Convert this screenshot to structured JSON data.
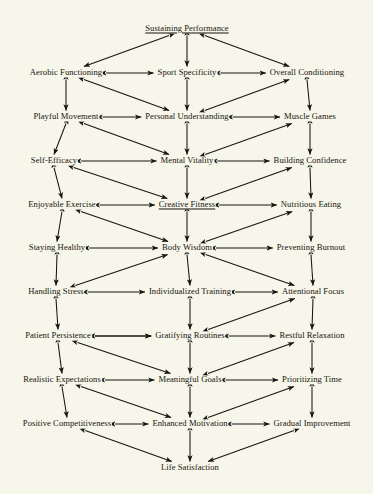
{
  "diagram": {
    "type": "concept-map",
    "background_color": "#f7f6ea",
    "text_color": "#17150f",
    "edge_color": "#17150f",
    "rows": [
      {
        "row": 1,
        "y": 29,
        "nodes": [
          {
            "id": "sustaining-performance",
            "label": "Sustaining Performance",
            "x": 187,
            "column": "center",
            "highlight": true
          }
        ]
      },
      {
        "row": 2,
        "y": 73,
        "nodes": [
          {
            "id": "aerobic-functioning",
            "label": "Aerobic Functioning",
            "x": 66,
            "column": "left",
            "highlight": false
          },
          {
            "id": "sport-specificity",
            "label": "Sport Specificity",
            "x": 187,
            "column": "center",
            "highlight": false
          },
          {
            "id": "overall-conditioning",
            "label": "Overall Conditioning",
            "x": 307,
            "column": "right",
            "highlight": false
          }
        ]
      },
      {
        "row": 3,
        "y": 117,
        "nodes": [
          {
            "id": "playful-movement",
            "label": "Playful Movement",
            "x": 66,
            "column": "left",
            "highlight": false
          },
          {
            "id": "personal-understanding",
            "label": "Personal Understanding",
            "x": 187,
            "column": "center",
            "highlight": false
          },
          {
            "id": "muscle-games",
            "label": "Muscle Games",
            "x": 310,
            "column": "right",
            "highlight": false
          }
        ]
      },
      {
        "row": 4,
        "y": 161,
        "nodes": [
          {
            "id": "self-efficacy",
            "label": "Self-Efficacy",
            "x": 54,
            "column": "left",
            "highlight": false
          },
          {
            "id": "mental-vitality",
            "label": "Mental Vitality",
            "x": 187,
            "column": "center",
            "highlight": false
          },
          {
            "id": "building-confidence",
            "label": "Building Confidence",
            "x": 310,
            "column": "right",
            "highlight": false
          }
        ]
      },
      {
        "row": 5,
        "y": 205,
        "nodes": [
          {
            "id": "enjoyable-exercise",
            "label": "Enjoyable Exercise",
            "x": 62,
            "column": "left",
            "highlight": false
          },
          {
            "id": "creative-fitness",
            "label": "Creative Fitness",
            "x": 187,
            "column": "center",
            "highlight": true
          },
          {
            "id": "nutritious-eating",
            "label": "Nutritious Eating",
            "x": 311,
            "column": "right",
            "highlight": false
          }
        ]
      },
      {
        "row": 6,
        "y": 248,
        "nodes": [
          {
            "id": "staying-healthy",
            "label": "Staying Healthy",
            "x": 57,
            "column": "left",
            "highlight": false
          },
          {
            "id": "body-wisdom",
            "label": "Body Wisdom",
            "x": 187,
            "column": "center",
            "highlight": false
          },
          {
            "id": "preventing-burnout",
            "label": "Preventing Burnout",
            "x": 311,
            "column": "right",
            "highlight": false
          }
        ]
      },
      {
        "row": 7,
        "y": 292,
        "nodes": [
          {
            "id": "handling-stress",
            "label": "Handling Stress",
            "x": 56,
            "column": "left",
            "highlight": false
          },
          {
            "id": "individualized-training",
            "label": "Individualized Training",
            "x": 190,
            "column": "center",
            "highlight": false
          },
          {
            "id": "attentional-focus",
            "label": "Attentional Focus",
            "x": 313,
            "column": "right",
            "highlight": false
          }
        ]
      },
      {
        "row": 8,
        "y": 336,
        "nodes": [
          {
            "id": "patient-persistence",
            "label": "Patient Persistence",
            "x": 58,
            "column": "left",
            "highlight": false
          },
          {
            "id": "gratifying-routines",
            "label": "Gratifying Routines",
            "x": 190,
            "column": "center",
            "highlight": false
          },
          {
            "id": "restful-relaxation",
            "label": "Restful Relaxation",
            "x": 312,
            "column": "right",
            "highlight": false
          }
        ]
      },
      {
        "row": 9,
        "y": 380,
        "nodes": [
          {
            "id": "realistic-expectations",
            "label": "Realistic Expectations",
            "x": 62,
            "column": "left",
            "highlight": false
          },
          {
            "id": "meaningful-goals",
            "label": "Meaningful Goals",
            "x": 190,
            "column": "center",
            "highlight": false
          },
          {
            "id": "prioritizing-time",
            "label": "Prioritizing Time",
            "x": 312,
            "column": "right",
            "highlight": false
          }
        ]
      },
      {
        "row": 10,
        "y": 424,
        "nodes": [
          {
            "id": "positive-competitiveness",
            "label": "Positive Competitiveness",
            "x": 67,
            "column": "left",
            "highlight": false
          },
          {
            "id": "enhanced-motivation",
            "label": "Enhanced Motivation",
            "x": 190,
            "column": "center",
            "highlight": false
          },
          {
            "id": "gradual-improvement",
            "label": "Gradual Improvement",
            "x": 312,
            "column": "right",
            "highlight": false
          }
        ]
      },
      {
        "row": 11,
        "y": 468,
        "nodes": [
          {
            "id": "life-satisfaction",
            "label": "Life Satisfaction",
            "x": 190,
            "column": "center",
            "highlight": false
          }
        ]
      }
    ],
    "edges": [
      {
        "from": "sustaining-performance",
        "to": "aerobic-functioning",
        "style": "diagonal",
        "arrow": "both"
      },
      {
        "from": "sustaining-performance",
        "to": "sport-specificity",
        "style": "vertical",
        "arrow": "both"
      },
      {
        "from": "sustaining-performance",
        "to": "overall-conditioning",
        "style": "diagonal",
        "arrow": "both"
      },
      {
        "from": "aerobic-functioning",
        "to": "sport-specificity",
        "style": "horizontal",
        "arrow": "both"
      },
      {
        "from": "sport-specificity",
        "to": "overall-conditioning",
        "style": "horizontal",
        "arrow": "both"
      },
      {
        "from": "aerobic-functioning",
        "to": "playful-movement",
        "style": "vertical",
        "arrow": "both"
      },
      {
        "from": "sport-specificity",
        "to": "personal-understanding",
        "style": "vertical",
        "arrow": "both"
      },
      {
        "from": "overall-conditioning",
        "to": "muscle-games",
        "style": "vertical",
        "arrow": "both"
      },
      {
        "from": "aerobic-functioning",
        "to": "personal-understanding",
        "style": "diagonal",
        "arrow": "both"
      },
      {
        "from": "personal-understanding",
        "to": "overall-conditioning",
        "style": "diagonal",
        "arrow": "both"
      },
      {
        "from": "playful-movement",
        "to": "personal-understanding",
        "style": "horizontal",
        "arrow": "both"
      },
      {
        "from": "personal-understanding",
        "to": "muscle-games",
        "style": "horizontal",
        "arrow": "both"
      },
      {
        "from": "playful-movement",
        "to": "self-efficacy",
        "style": "vertical",
        "arrow": "both"
      },
      {
        "from": "personal-understanding",
        "to": "mental-vitality",
        "style": "vertical",
        "arrow": "both"
      },
      {
        "from": "muscle-games",
        "to": "building-confidence",
        "style": "vertical",
        "arrow": "both"
      },
      {
        "from": "playful-movement",
        "to": "mental-vitality",
        "style": "diagonal",
        "arrow": "both"
      },
      {
        "from": "mental-vitality",
        "to": "muscle-games",
        "style": "diagonal",
        "arrow": "both"
      },
      {
        "from": "self-efficacy",
        "to": "mental-vitality",
        "style": "horizontal",
        "arrow": "both"
      },
      {
        "from": "mental-vitality",
        "to": "building-confidence",
        "style": "horizontal",
        "arrow": "both"
      },
      {
        "from": "self-efficacy",
        "to": "enjoyable-exercise",
        "style": "vertical",
        "arrow": "both"
      },
      {
        "from": "mental-vitality",
        "to": "creative-fitness",
        "style": "vertical",
        "arrow": "both"
      },
      {
        "from": "building-confidence",
        "to": "nutritious-eating",
        "style": "vertical",
        "arrow": "both"
      },
      {
        "from": "self-efficacy",
        "to": "creative-fitness",
        "style": "diagonal",
        "arrow": "both"
      },
      {
        "from": "creative-fitness",
        "to": "building-confidence",
        "style": "diagonal",
        "arrow": "both"
      },
      {
        "from": "enjoyable-exercise",
        "to": "creative-fitness",
        "style": "horizontal",
        "arrow": "both"
      },
      {
        "from": "creative-fitness",
        "to": "nutritious-eating",
        "style": "horizontal",
        "arrow": "both"
      },
      {
        "from": "enjoyable-exercise",
        "to": "staying-healthy",
        "style": "vertical",
        "arrow": "both"
      },
      {
        "from": "creative-fitness",
        "to": "body-wisdom",
        "style": "vertical",
        "arrow": "both"
      },
      {
        "from": "nutritious-eating",
        "to": "preventing-burnout",
        "style": "vertical",
        "arrow": "both"
      },
      {
        "from": "enjoyable-exercise",
        "to": "body-wisdom",
        "style": "diagonal",
        "arrow": "both"
      },
      {
        "from": "body-wisdom",
        "to": "nutritious-eating",
        "style": "diagonal",
        "arrow": "both"
      },
      {
        "from": "staying-healthy",
        "to": "body-wisdom",
        "style": "horizontal",
        "arrow": "both"
      },
      {
        "from": "body-wisdom",
        "to": "preventing-burnout",
        "style": "horizontal",
        "arrow": "both"
      },
      {
        "from": "staying-healthy",
        "to": "handling-stress",
        "style": "vertical",
        "arrow": "both"
      },
      {
        "from": "body-wisdom",
        "to": "individualized-training",
        "style": "vertical",
        "arrow": "both"
      },
      {
        "from": "preventing-burnout",
        "to": "attentional-focus",
        "style": "vertical",
        "arrow": "both"
      },
      {
        "from": "handling-stress",
        "to": "body-wisdom",
        "style": "diagonal",
        "arrow": "both"
      },
      {
        "from": "body-wisdom",
        "to": "attentional-focus",
        "style": "diagonal",
        "arrow": "both"
      },
      {
        "from": "handling-stress",
        "to": "individualized-training",
        "style": "horizontal",
        "arrow": "both"
      },
      {
        "from": "individualized-training",
        "to": "attentional-focus",
        "style": "horizontal",
        "arrow": "both"
      },
      {
        "from": "handling-stress",
        "to": "patient-persistence",
        "style": "vertical",
        "arrow": "both"
      },
      {
        "from": "individualized-training",
        "to": "gratifying-routines",
        "style": "vertical",
        "arrow": "both"
      },
      {
        "from": "attentional-focus",
        "to": "restful-relaxation",
        "style": "vertical",
        "arrow": "both"
      },
      {
        "from": "patient-persistence",
        "to": "gratifying-routines",
        "style": "diagonal",
        "arrow": "both"
      },
      {
        "from": "gratifying-routines",
        "to": "attentional-focus",
        "style": "diagonal",
        "arrow": "both"
      },
      {
        "from": "patient-persistence",
        "to": "gratifying-routines",
        "style": "horizontal",
        "arrow": "both"
      },
      {
        "from": "gratifying-routines",
        "to": "restful-relaxation",
        "style": "horizontal",
        "arrow": "both"
      },
      {
        "from": "patient-persistence",
        "to": "realistic-expectations",
        "style": "vertical",
        "arrow": "both"
      },
      {
        "from": "gratifying-routines",
        "to": "meaningful-goals",
        "style": "vertical",
        "arrow": "both"
      },
      {
        "from": "restful-relaxation",
        "to": "prioritizing-time",
        "style": "vertical",
        "arrow": "both"
      },
      {
        "from": "patient-persistence",
        "to": "meaningful-goals",
        "style": "diagonal",
        "arrow": "both"
      },
      {
        "from": "meaningful-goals",
        "to": "restful-relaxation",
        "style": "diagonal",
        "arrow": "both"
      },
      {
        "from": "realistic-expectations",
        "to": "meaningful-goals",
        "style": "horizontal",
        "arrow": "both"
      },
      {
        "from": "meaningful-goals",
        "to": "prioritizing-time",
        "style": "horizontal",
        "arrow": "both"
      },
      {
        "from": "realistic-expectations",
        "to": "positive-competitiveness",
        "style": "vertical",
        "arrow": "both"
      },
      {
        "from": "meaningful-goals",
        "to": "enhanced-motivation",
        "style": "vertical",
        "arrow": "both"
      },
      {
        "from": "prioritizing-time",
        "to": "gradual-improvement",
        "style": "vertical",
        "arrow": "both"
      },
      {
        "from": "realistic-expectations",
        "to": "enhanced-motivation",
        "style": "diagonal",
        "arrow": "both"
      },
      {
        "from": "enhanced-motivation",
        "to": "prioritizing-time",
        "style": "diagonal",
        "arrow": "both"
      },
      {
        "from": "positive-competitiveness",
        "to": "enhanced-motivation",
        "style": "horizontal",
        "arrow": "both"
      },
      {
        "from": "enhanced-motivation",
        "to": "gradual-improvement",
        "style": "horizontal",
        "arrow": "both"
      },
      {
        "from": "positive-competitiveness",
        "to": "life-satisfaction",
        "style": "diagonal",
        "arrow": "both"
      },
      {
        "from": "enhanced-motivation",
        "to": "life-satisfaction",
        "style": "vertical",
        "arrow": "both"
      },
      {
        "from": "gradual-improvement",
        "to": "life-satisfaction",
        "style": "diagonal",
        "arrow": "both"
      }
    ]
  }
}
